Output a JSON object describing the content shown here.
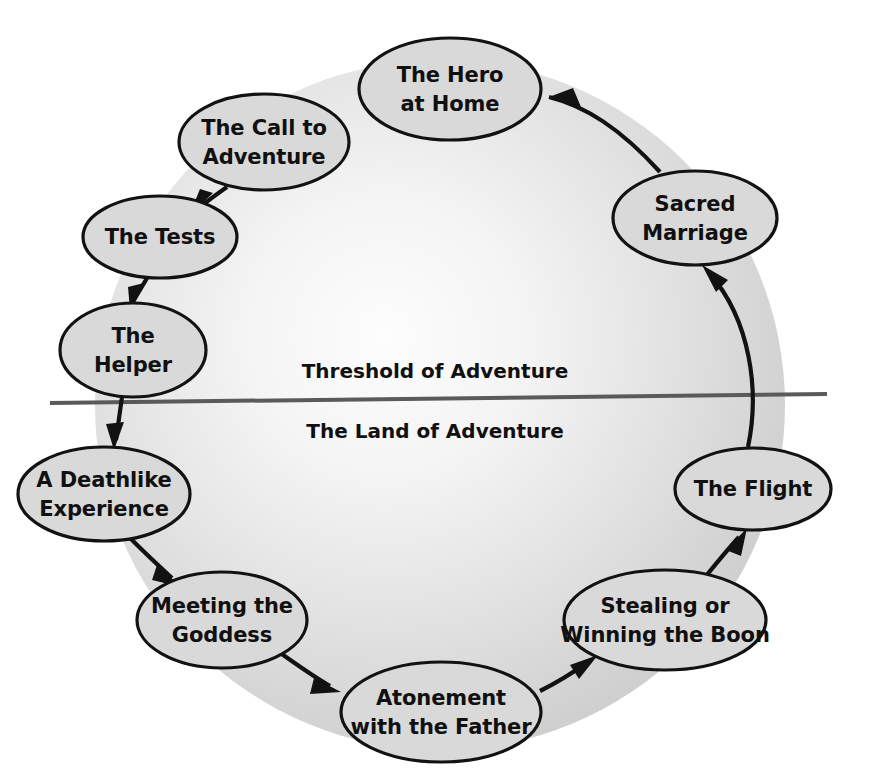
{
  "diagram": {
    "background_color": "#ffffff",
    "circle_fill_outer": "#d2d2d2",
    "circle_fill_inner": "#fafafa",
    "node_fill": "#d9d9d9",
    "node_stroke": "#121212",
    "threshold_line_color": "#5a5a5a",
    "zones": [
      {
        "id": "threshold",
        "label": "Threshold of Adventure",
        "x": 435,
        "y": 372
      },
      {
        "id": "land",
        "label": "The Land of Adventure",
        "x": 435,
        "y": 432
      }
    ],
    "nodes": [
      {
        "id": "hero-at-home",
        "line1": "The Hero",
        "line2": "at Home",
        "cx": 450,
        "cy": 89,
        "rx": 91,
        "ry": 51
      },
      {
        "id": "call-to-adventure",
        "line1": "The Call to",
        "line2": "Adventure",
        "cx": 264,
        "cy": 142,
        "rx": 85,
        "ry": 48
      },
      {
        "id": "the-tests",
        "line1": "The Tests",
        "line2": "",
        "cx": 160,
        "cy": 237,
        "rx": 77,
        "ry": 41
      },
      {
        "id": "the-helper",
        "line1": "The",
        "line2": "Helper",
        "cx": 133,
        "cy": 350,
        "rx": 73,
        "ry": 47
      },
      {
        "id": "deathlike-experience",
        "line1": "A Deathlike",
        "line2": "Experience",
        "cx": 104,
        "cy": 494,
        "rx": 86,
        "ry": 47
      },
      {
        "id": "meeting-the-goddess",
        "line1": "Meeting the",
        "line2": "Goddess",
        "cx": 222,
        "cy": 620,
        "rx": 85,
        "ry": 48
      },
      {
        "id": "atonement",
        "line1": "Atonement",
        "line2": "with the Father",
        "cx": 441,
        "cy": 712,
        "rx": 100,
        "ry": 50
      },
      {
        "id": "stealing-boon",
        "line1": "Stealing or",
        "line2": "Winning the Boon",
        "cx": 665,
        "cy": 620,
        "rx": 101,
        "ry": 50
      },
      {
        "id": "the-flight",
        "line1": "The Flight",
        "line2": "",
        "cx": 753,
        "cy": 489,
        "rx": 78,
        "ry": 41
      },
      {
        "id": "sacred-marriage",
        "line1": "Sacred",
        "line2": "Marriage",
        "cx": 695,
        "cy": 218,
        "rx": 82,
        "ry": 47
      }
    ],
    "edges": [
      {
        "id": "edge-hero-to-call",
        "from": "hero-at-home",
        "to": "call-to-adventure"
      },
      {
        "id": "edge-call-to-tests",
        "from": "call-to-adventure",
        "to": "the-tests"
      },
      {
        "id": "edge-tests-to-helper",
        "from": "the-tests",
        "to": "the-helper"
      },
      {
        "id": "edge-helper-to-death",
        "from": "the-helper",
        "to": "deathlike-experience"
      },
      {
        "id": "edge-death-to-goddess",
        "from": "deathlike-experience",
        "to": "meeting-the-goddess"
      },
      {
        "id": "edge-goddess-to-atonement",
        "from": "meeting-the-goddess",
        "to": "atonement"
      },
      {
        "id": "edge-atonement-to-boon",
        "from": "atonement",
        "to": "stealing-boon"
      },
      {
        "id": "edge-boon-to-flight",
        "from": "stealing-boon",
        "to": "the-flight"
      },
      {
        "id": "edge-flight-to-marriage",
        "from": "the-flight",
        "to": "sacred-marriage"
      },
      {
        "id": "edge-marriage-to-hero",
        "from": "sacred-marriage",
        "to": "hero-at-home"
      }
    ]
  }
}
